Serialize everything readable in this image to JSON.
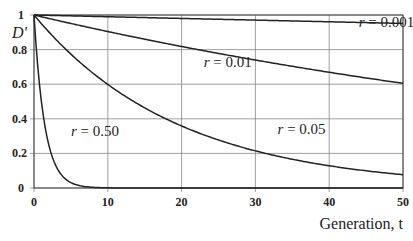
{
  "chart_data": {
    "type": "line",
    "title": "",
    "xlabel": "Generation, t",
    "ylabel": "D'",
    "xlim": [
      0,
      50
    ],
    "ylim": [
      0,
      1
    ],
    "x_ticks": [
      0,
      10,
      20,
      30,
      40,
      50
    ],
    "y_ticks": [
      0,
      0.2,
      0.4,
      0.6,
      0.8,
      1
    ],
    "y_tick_labels": [
      "0",
      "0.2",
      "0.4",
      "0.6",
      "0.8",
      "1"
    ],
    "grid": true,
    "legend": "inline labels",
    "x": [
      0,
      5,
      10,
      15,
      20,
      25,
      30,
      35,
      40,
      45,
      50
    ],
    "series": [
      {
        "name": "r = 0.001",
        "label_pos": [
          44,
          0.93
        ],
        "values": [
          1.0,
          0.995,
          0.99,
          0.985,
          0.98,
          0.975,
          0.97,
          0.966,
          0.961,
          0.956,
          0.951
        ]
      },
      {
        "name": "r = 0.01",
        "label_pos": [
          23,
          0.7
        ],
        "values": [
          1.0,
          0.951,
          0.904,
          0.86,
          0.818,
          0.778,
          0.74,
          0.703,
          0.669,
          0.636,
          0.605
        ]
      },
      {
        "name": "r = 0.05",
        "label_pos": [
          33,
          0.31
        ],
        "values": [
          1.0,
          0.774,
          0.599,
          0.463,
          0.358,
          0.277,
          0.215,
          0.166,
          0.129,
          0.099,
          0.077
        ]
      },
      {
        "name": "r = 0.50",
        "label_pos": [
          5,
          0.3
        ],
        "values": [
          1.0,
          0.031,
          0.001,
          0.0,
          0.0,
          0.0,
          0.0,
          0.0,
          0.0,
          0.0,
          0.0
        ]
      }
    ],
    "formula": "D' = (1 - r)^t"
  }
}
